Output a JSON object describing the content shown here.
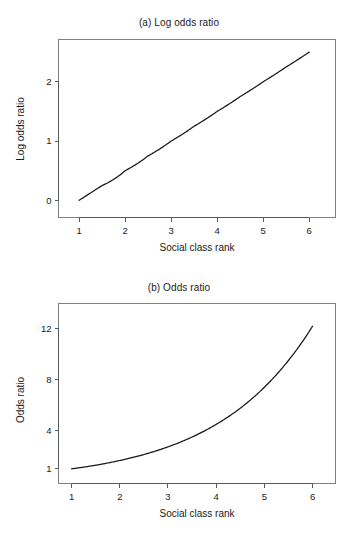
{
  "figure": {
    "background_color": "#ffffff",
    "line_color": "#16181a",
    "axis_color": "#555a5c",
    "frame_color": "#7d8184"
  },
  "chart_data": [
    {
      "type": "line",
      "panel": "a",
      "title": "(a) Log odds ratio",
      "xlabel": "Social class rank",
      "ylabel": "Log odds ratio",
      "xlim": [
        0.78,
        6.3
      ],
      "ylim": [
        -0.18,
        2.62
      ],
      "xticks": [
        1,
        2,
        3,
        4,
        5,
        6
      ],
      "xticklabels": [
        "1",
        "2",
        "3",
        "4",
        "5",
        "6"
      ],
      "yticks": [
        0,
        1,
        2
      ],
      "yticklabels": [
        "0",
        "1",
        "2"
      ],
      "grid": false,
      "legend": null,
      "series": [
        {
          "name": "log odds ratio",
          "equation": "y = 0.5 * (x - 1)",
          "x": [
            1,
            1.5,
            2,
            2.5,
            3,
            3.5,
            4,
            4.5,
            5,
            5.5,
            6
          ],
          "values": [
            0,
            0.25,
            0.5,
            0.75,
            1,
            1.25,
            1.5,
            1.75,
            2,
            2.25,
            2.5
          ]
        }
      ]
    },
    {
      "type": "line",
      "panel": "b",
      "title": "(b) Odds ratio",
      "xlabel": "Social class rank",
      "ylabel": "Odds ratio",
      "xlim": [
        0.78,
        6.3
      ],
      "ylim": [
        0.2,
        12.9
      ],
      "xticks": [
        1,
        2,
        3,
        4,
        5,
        6
      ],
      "xticklabels": [
        "1",
        "2",
        "3",
        "4",
        "5",
        "6"
      ],
      "yticks": [
        1,
        4,
        8,
        12
      ],
      "yticklabels": [
        "1",
        "4",
        "8",
        "12"
      ],
      "grid": false,
      "legend": null,
      "series": [
        {
          "name": "odds ratio",
          "equation": "y = exp(0.5 * (x - 1))",
          "x": [
            1,
            1.5,
            2,
            2.5,
            3,
            3.5,
            4,
            4.5,
            5,
            5.5,
            6
          ],
          "values": [
            1,
            1.28,
            1.65,
            2.12,
            2.72,
            3.49,
            4.48,
            5.75,
            7.39,
            9.49,
            12.18
          ]
        }
      ]
    }
  ]
}
